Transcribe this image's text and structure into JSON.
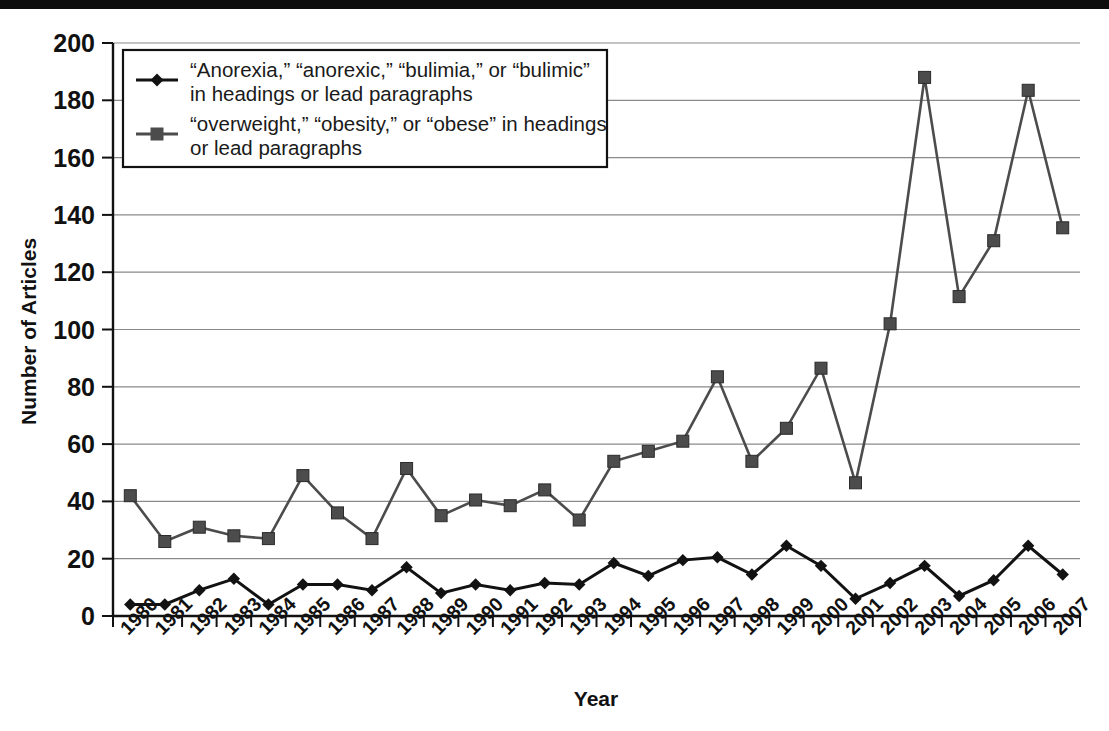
{
  "figure": {
    "ylabel": "Number of Articles",
    "xlabel": "Year",
    "legend": {
      "entry1_line1": "“Anorexia,” “anorexic,” “bulimia,” or “bulimic”",
      "entry1_line2": "in headings or lead paragraphs",
      "entry2_line1": "“overweight,” “obesity,” or “obese” in headings",
      "entry2_line2": "or lead paragraphs"
    },
    "colors": {
      "series_eating_disorder": "#121212",
      "series_obesity": "#4c4c4c",
      "gridline": "#8a8a8a",
      "axis": "#111111",
      "background": "#ffffff"
    }
  },
  "chart_data": {
    "type": "line",
    "title": "",
    "xlabel": "Year",
    "ylabel": "Number of Articles",
    "xlim": [
      1980,
      2007
    ],
    "ylim": [
      0,
      200
    ],
    "ytick_labels": [
      "0",
      "20",
      "40",
      "60",
      "80",
      "100",
      "120",
      "140",
      "160",
      "180",
      "200"
    ],
    "yticks": [
      0,
      20,
      40,
      60,
      80,
      100,
      120,
      140,
      160,
      180,
      200
    ],
    "grid": "horizontal",
    "legend_position": "upper-left-inside",
    "categories": [
      1980,
      1981,
      1982,
      1983,
      1984,
      1985,
      1986,
      1987,
      1988,
      1989,
      1990,
      1991,
      1992,
      1993,
      1994,
      1995,
      1996,
      1997,
      1998,
      1999,
      2000,
      2001,
      2002,
      2003,
      2004,
      2005,
      2006,
      2007
    ],
    "x_tick_labels": [
      "1980",
      "1981",
      "1982",
      "1983",
      "1984",
      "1985",
      "1986",
      "1987",
      "1988",
      "1989",
      "1990",
      "1991",
      "1992",
      "1993",
      "1994",
      "1995",
      "1996",
      "1997",
      "1998",
      "1999",
      "2000",
      "2001",
      "2002",
      "2003",
      "2004",
      "2005",
      "2006",
      "2007"
    ],
    "series": [
      {
        "name": "“Anorexia,” “anorexic,” “bulimia,” or “bulimic” in headings or lead paragraphs",
        "marker": "diamond",
        "color": "#121212",
        "values": [
          4,
          4,
          9,
          13,
          4,
          11,
          11,
          9,
          17,
          8,
          11,
          9,
          11.5,
          11,
          18.5,
          14,
          19.5,
          20.5,
          14.5,
          24.5,
          17.5,
          6,
          11.5,
          17.5,
          7,
          12.5,
          24.5,
          14.5
        ]
      },
      {
        "name": "“overweight,” “obesity,” or “obese” in headings or lead paragraphs",
        "marker": "square",
        "color": "#4c4c4c",
        "values": [
          42,
          26,
          31,
          28,
          27,
          49,
          36,
          27,
          51.5,
          35,
          40.5,
          38.5,
          44,
          33.5,
          54,
          57.5,
          61,
          83.5,
          54,
          65.5,
          86.5,
          46.5,
          102,
          188,
          111.5,
          131,
          183.5,
          135.5
        ]
      }
    ]
  }
}
